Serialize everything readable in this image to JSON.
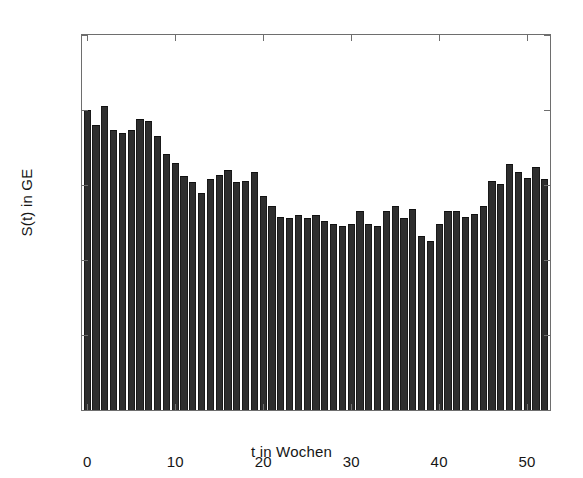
{
  "chart_data": {
    "type": "bar",
    "title": "",
    "subtitle": "",
    "xlabel": "t in Wochen",
    "ylabel": "S(t) in GE",
    "xlim": [
      -0.6,
      52.6
    ],
    "ylim": [
      0,
      250
    ],
    "xticks": [
      0,
      10,
      20,
      30,
      40,
      50
    ],
    "xtick_labels": [
      "0",
      "10",
      "20",
      "30",
      "40",
      "50"
    ],
    "yticks": [
      0,
      50,
      100,
      150,
      200,
      250
    ],
    "ytick_labels": [
      "0",
      "50",
      "100",
      "150",
      "200",
      "250"
    ],
    "grid": false,
    "legend": null,
    "bar_color": "#2e2e2e",
    "bar_edge_color": "#1a1a1a",
    "axes_color": "#6e6e6e",
    "background_color": "#ffffff",
    "categories": [
      0,
      1,
      2,
      3,
      4,
      5,
      6,
      7,
      8,
      9,
      10,
      11,
      12,
      13,
      14,
      15,
      16,
      17,
      18,
      19,
      20,
      21,
      22,
      23,
      24,
      25,
      26,
      27,
      28,
      29,
      30,
      31,
      32,
      33,
      34,
      35,
      36,
      37,
      38,
      39,
      40,
      41,
      42,
      43,
      44,
      45,
      46,
      47,
      48,
      49,
      50,
      51,
      52
    ],
    "values": [
      200,
      190,
      203,
      187,
      185,
      187,
      194,
      193,
      183,
      171,
      165,
      156,
      152,
      145,
      154,
      157,
      160,
      152,
      153,
      159,
      143,
      136,
      129,
      128,
      130,
      128,
      130,
      126,
      124,
      123,
      124,
      133,
      124,
      123,
      133,
      136,
      128,
      134,
      116,
      113,
      124,
      133,
      133,
      129,
      131,
      136,
      153,
      151,
      164,
      159,
      155,
      162,
      154
    ]
  }
}
